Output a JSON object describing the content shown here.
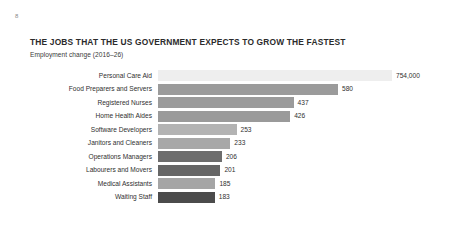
{
  "page": {
    "marker": "8",
    "background_color": "#ffffff"
  },
  "chart_data": {
    "type": "bar",
    "orientation": "horizontal",
    "title": "THE JOBS THAT THE US GOVERNMENT EXPECTS TO GROW THE FASTEST",
    "subtitle": "Employment change (2016–26)",
    "xlabel": "",
    "ylabel": "",
    "grid": false,
    "legend": false,
    "axis_visible": false,
    "xlim": [
      0,
      754
    ],
    "categories": [
      "Personal Care Aid",
      "Food Preparers and Servers",
      "Registered Nurses",
      "Home Health Aides",
      "Software Developers",
      "Janitors and Cleaners",
      "Operations Managers",
      "Labourers and Movers",
      "Medical Assistants",
      "Waiting Staff"
    ],
    "values": [
      754,
      580,
      437,
      426,
      253,
      233,
      206,
      201,
      185,
      183
    ],
    "value_labels": [
      "754,000",
      "580",
      "437",
      "426",
      "253",
      "233",
      "206",
      "201",
      "185",
      "183"
    ],
    "bar_colors": [
      "#eeeeee",
      "#9b9b9b",
      "#9b9b9b",
      "#9a9a9a",
      "#b3b3b3",
      "#a8a8a8",
      "#6d6d6d",
      "#666666",
      "#a5a5a5",
      "#4b4b4b"
    ],
    "bars": [
      {
        "category": "Personal Care Aid",
        "value": 754,
        "label": "754,000",
        "color": "#eeeeee"
      },
      {
        "category": "Food Preparers and Servers",
        "value": 580,
        "label": "580",
        "color": "#9b9b9b"
      },
      {
        "category": "Registered Nurses",
        "value": 437,
        "label": "437",
        "color": "#9b9b9b"
      },
      {
        "category": "Home Health Aides",
        "value": 426,
        "label": "426",
        "color": "#9a9a9a"
      },
      {
        "category": "Software Developers",
        "value": 253,
        "label": "253",
        "color": "#b3b3b3"
      },
      {
        "category": "Janitors and Cleaners",
        "value": 233,
        "label": "233",
        "color": "#a8a8a8"
      },
      {
        "category": "Operations Managers",
        "value": 206,
        "label": "206",
        "color": "#6d6d6d"
      },
      {
        "category": "Labourers and Movers",
        "value": 201,
        "label": "201",
        "color": "#666666"
      },
      {
        "category": "Medical Assistants",
        "value": 185,
        "label": "185",
        "color": "#a5a5a5"
      },
      {
        "category": "Waiting Staff",
        "value": 183,
        "label": "183",
        "color": "#4b4b4b"
      }
    ],
    "units_note": "values in thousands; top bar annotated as 754,000"
  }
}
